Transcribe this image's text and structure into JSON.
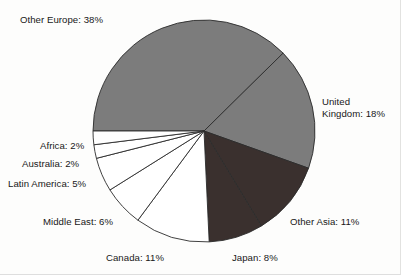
{
  "chart_data": {
    "type": "pie",
    "title": "",
    "xlabel": "",
    "ylabel": "",
    "grid": false,
    "legend_position": "none",
    "labels_on_slices": false,
    "start_angle_deg": 180,
    "direction": "clockwise",
    "categories": [
      "Other Europe",
      "United Kingdom",
      "Other Asia",
      "Japan",
      "Canada",
      "Middle East",
      "Latin America",
      "Australia",
      "Africa"
    ],
    "values": [
      38,
      18,
      11,
      8,
      11,
      6,
      5,
      2,
      2
    ],
    "unit": "%",
    "slice_colors": [
      "#7c7c7c",
      "#7c7c7c",
      "#3a302e",
      "#3a302e",
      "#ffffff",
      "#ffffff",
      "#ffffff",
      "#ffffff",
      "#ffffff"
    ],
    "annotations": [
      {
        "text": "Other Europe: 38%",
        "category": "Other Europe",
        "value": 38
      },
      {
        "text": "United\nKingdom: 18%",
        "category": "United Kingdom",
        "value": 18
      },
      {
        "text": "Other Asia: 11%",
        "category": "Other Asia",
        "value": 11
      },
      {
        "text": "Japan: 8%",
        "category": "Japan",
        "value": 8
      },
      {
        "text": "Canada: 11%",
        "category": "Canada",
        "value": 11
      },
      {
        "text": "Middle East: 6%",
        "category": "Middle East",
        "value": 6
      },
      {
        "text": "Latin America: 5%",
        "category": "Latin America",
        "value": 5
      },
      {
        "text": "Australia: 2%",
        "category": "Australia",
        "value": 2
      },
      {
        "text": "Africa: 2%",
        "category": "Africa",
        "value": 2
      }
    ]
  },
  "labels": {
    "other_europe": "Other Europe: 38%",
    "united_kingdom": "United\nKingdom: 18%",
    "other_asia": "Other Asia: 11%",
    "japan": "Japan: 8%",
    "canada": "Canada: 11%",
    "middle_east": "Middle East: 6%",
    "latin_america": "Latin America: 5%",
    "australia": "Australia: 2%",
    "africa": "Africa: 2%"
  },
  "style": {
    "background": "#fdfdfc",
    "outline": "#2b2b2b",
    "gray_fill": "#7c7c7c",
    "dark_fill": "#3a302e",
    "white_fill": "#ffffff",
    "text_color": "#181818"
  },
  "geometry": {
    "center_x": 204,
    "center_y": 131,
    "radius": 111
  }
}
